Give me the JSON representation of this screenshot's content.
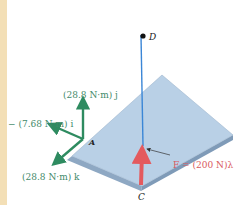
{
  "figure": {
    "colors": {
      "moment": "#2e8b60",
      "force": "#e45a5e",
      "line_cd": "#3b86d6",
      "plate_top": "#b9d0e6",
      "plate_edge": "#8ea8c3",
      "band": "#f3dfb6"
    },
    "labels": {
      "point_d": "D",
      "point_a": "A",
      "point_c": "C",
      "moment_j": "(28.8 N·m) j",
      "moment_i": "− (7.68 N·m) i",
      "moment_k": "(28.8 N·m) k",
      "force": "F = (200 N)λ"
    }
  }
}
